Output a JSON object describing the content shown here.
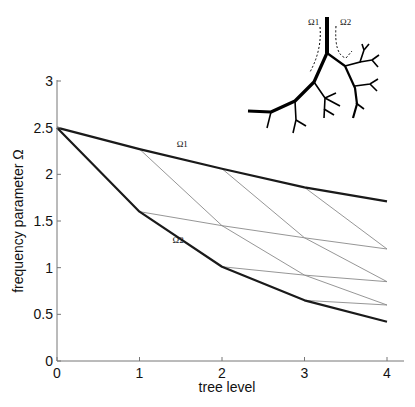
{
  "chart_data": {
    "type": "line",
    "title": "",
    "xlabel": "tree level",
    "ylabel": "frequency parameter Ω",
    "xlim": [
      0,
      4
    ],
    "ylim": [
      0,
      3
    ],
    "x_ticks": [
      "0",
      "1",
      "2",
      "3",
      "4"
    ],
    "y_ticks": [
      "0",
      "0.5",
      "1",
      "1.5",
      "2",
      "2.5",
      "3"
    ],
    "grid": false,
    "x": [
      0,
      1,
      2,
      3,
      4
    ],
    "series": [
      {
        "name": "Ω1",
        "style": "thick",
        "values": [
          2.5,
          2.27,
          2.06,
          1.86,
          1.71
        ]
      },
      {
        "name": "Ω2",
        "style": "thick",
        "values": [
          2.5,
          1.6,
          1.01,
          0.65,
          0.42
        ]
      }
    ],
    "thin_lines": [
      {
        "points": [
          [
            1,
            2.27
          ],
          [
            2,
            1.45
          ],
          [
            3,
            0.92
          ],
          [
            4,
            0.6
          ]
        ]
      },
      {
        "points": [
          [
            2,
            2.06
          ],
          [
            3,
            1.32
          ],
          [
            4,
            0.85
          ]
        ]
      },
      {
        "points": [
          [
            3,
            1.86
          ],
          [
            4,
            1.2
          ]
        ]
      },
      {
        "points": [
          [
            1,
            1.6
          ],
          [
            2,
            1.45
          ],
          [
            3,
            1.32
          ],
          [
            4,
            1.2
          ]
        ]
      },
      {
        "points": [
          [
            2,
            1.01
          ],
          [
            3,
            0.92
          ],
          [
            4,
            0.85
          ]
        ]
      },
      {
        "points": [
          [
            3,
            0.65
          ],
          [
            4,
            0.6
          ]
        ]
      }
    ],
    "annotations": [
      {
        "text": "Ω1",
        "x": 1.45,
        "y": 2.27
      },
      {
        "text": "Ω2",
        "x": 1.4,
        "y": 1.24
      }
    ],
    "inset": {
      "description": "branching tree diagram with dashed arrows",
      "labels": [
        "Ω1",
        "Ω2"
      ]
    }
  }
}
